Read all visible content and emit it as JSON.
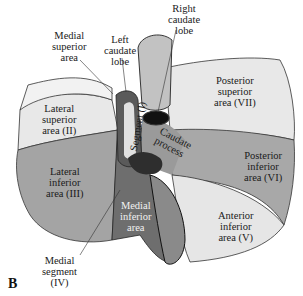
{
  "figure": {
    "panel_letter": "B",
    "colors": {
      "light_area": "#e6e6e6",
      "mid_area": "#a9a9a9",
      "dark_area": "#6e6e6e",
      "vessel": "#c4c4c4",
      "outline": "#222222",
      "background": "#ffffff"
    },
    "labels": {
      "medial_superior": "Medial\nsuperior\narea",
      "left_caudate": "Left\ncaudate\nlobe",
      "right_caudate": "Right\ncaudate\nlobe",
      "lateral_superior": "Lateral\nsuperior\narea (II)",
      "posterior_superior": "Posterior\nsuperior\narea (VII)",
      "segment_one": "Segment (I)",
      "caudate_process": "Caudate\nprocess",
      "posterior_inferior": "Posterior\ninferior\narea (VI)",
      "lateral_inferior": "Lateral\ninferior\narea (III)",
      "medial_inferior": "Medial\ninferior\narea",
      "anterior_inferior": "Anterior\ninferior\narea (V)",
      "medial_segment": "Medial\nsegment\n(IV)"
    }
  }
}
